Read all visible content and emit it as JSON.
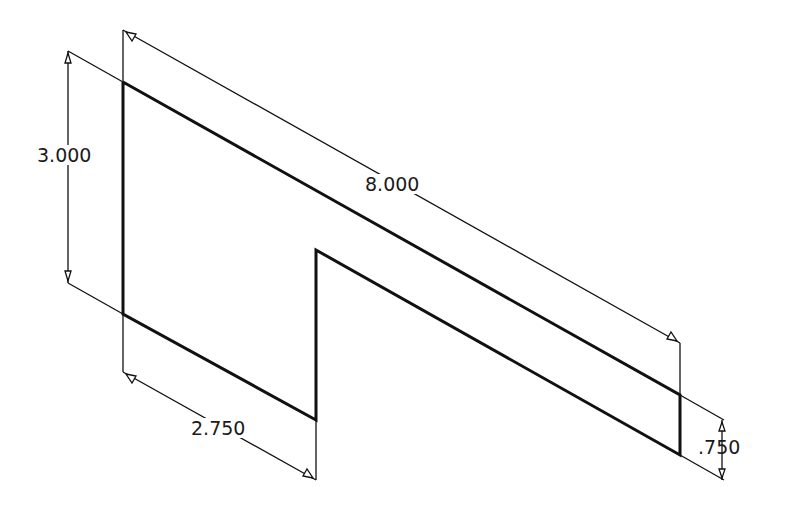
{
  "drawing": {
    "type": "isometric sketch with dimensions",
    "line_color": "#111111",
    "background": "#ffffff",
    "dimensions": [
      {
        "id": "height",
        "label": "3.000"
      },
      {
        "id": "length",
        "label": "8.000"
      },
      {
        "id": "notch-width",
        "label": "2.750"
      },
      {
        "id": "thickness",
        "label": ".750"
      }
    ]
  }
}
